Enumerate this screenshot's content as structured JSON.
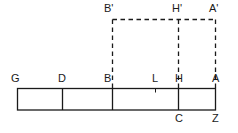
{
  "figure": {
    "type": "geometry-diagram",
    "colors": {
      "stroke": "#1a1a1a",
      "dashed_stroke": "#1a1a1a",
      "background": "#ffffff",
      "label": "#1a1a1a"
    },
    "solid_rect": {
      "x1": 17,
      "y1": 88,
      "x2": 216,
      "y2": 110,
      "dividers_x": [
        62,
        112,
        178
      ]
    },
    "dashed_rect": {
      "x1": 112,
      "y1": 19,
      "x2": 216,
      "y2": 88,
      "divider_x": 178
    },
    "tick": {
      "x": 155,
      "y": 88,
      "len": 4
    },
    "labels": [
      {
        "id": "label-B-prime",
        "text": "B'",
        "x": 104,
        "y": 3
      },
      {
        "id": "label-H-prime",
        "text": "H'",
        "x": 172,
        "y": 3
      },
      {
        "id": "label-A-prime",
        "text": "A'",
        "x": 209,
        "y": 3
      },
      {
        "id": "label-G",
        "text": "G",
        "x": 11,
        "y": 73
      },
      {
        "id": "label-D",
        "text": "D",
        "x": 58,
        "y": 73
      },
      {
        "id": "label-B",
        "text": "B",
        "x": 104,
        "y": 73
      },
      {
        "id": "label-L",
        "text": "L",
        "x": 152,
        "y": 73
      },
      {
        "id": "label-H",
        "text": "H",
        "x": 175,
        "y": 73
      },
      {
        "id": "label-A",
        "text": "A",
        "x": 212,
        "y": 73
      },
      {
        "id": "label-C",
        "text": "C",
        "x": 175,
        "y": 113
      },
      {
        "id": "label-Z",
        "text": "Z",
        "x": 212,
        "y": 113
      }
    ]
  }
}
